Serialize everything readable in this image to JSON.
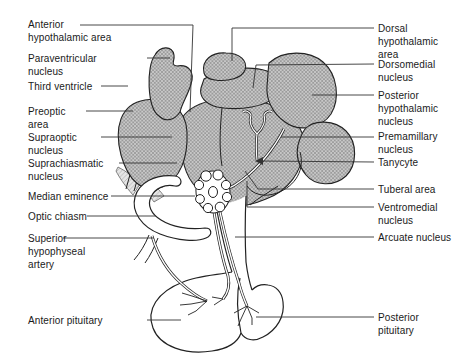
{
  "figure": {
    "type": "anatomical-diagram",
    "colors": {
      "outline": "#222222",
      "leader_line": "#333333",
      "hatch_fill": "#c9c9c9",
      "hatch_line": "#8e8e8e",
      "light_hatch_fill": "#e6e6e6",
      "background": "#ffffff",
      "label_text": "#1a1a1a"
    }
  },
  "labels": {
    "left": [
      {
        "name": "anterior-hypothalamic-area",
        "text": "Anterior\nhypothalamic area"
      },
      {
        "name": "paraventricular-nucleus",
        "text": "Paraventricular\nnucleus"
      },
      {
        "name": "third-ventricle",
        "text": "Third ventricle"
      },
      {
        "name": "preoptic-area",
        "text": "Preoptic\narea"
      },
      {
        "name": "supraoptic-nucleus",
        "text": "Supraoptic\nnucleus"
      },
      {
        "name": "suprachiasmatic-nucleus",
        "text": "Suprachiasmatic\nnucleus"
      },
      {
        "name": "median-eminence",
        "text": "Median eminence"
      },
      {
        "name": "optic-chiasm",
        "text": "Optic chiasm"
      },
      {
        "name": "superior-hypophyseal-artery",
        "text": "Superior\nhypophyseal\nartery"
      },
      {
        "name": "anterior-pituitary",
        "text": "Anterior pituitary"
      }
    ],
    "right": [
      {
        "name": "dorsal-hypothalamic-area",
        "text": "Dorsal\nhypothalamic\narea"
      },
      {
        "name": "dorsomedial-nucleus",
        "text": "Dorsomedial\nnucleus"
      },
      {
        "name": "posterior-hypothalamic-nucleus",
        "text": "Posterior\nhypothalamic\nnucleus"
      },
      {
        "name": "premamillary-nucleus",
        "text": "Premamillary\nnucleus"
      },
      {
        "name": "tanycyte",
        "text": "Tanycyte"
      },
      {
        "name": "tuberal-area",
        "text": "Tuberal area"
      },
      {
        "name": "ventromedial-nucleus",
        "text": "Ventromedial\nnucleus"
      },
      {
        "name": "arcuate-nucleus",
        "text": "Arcuate nucleus"
      },
      {
        "name": "posterior-pituitary",
        "text": "Posterior\npituitary"
      }
    ]
  }
}
